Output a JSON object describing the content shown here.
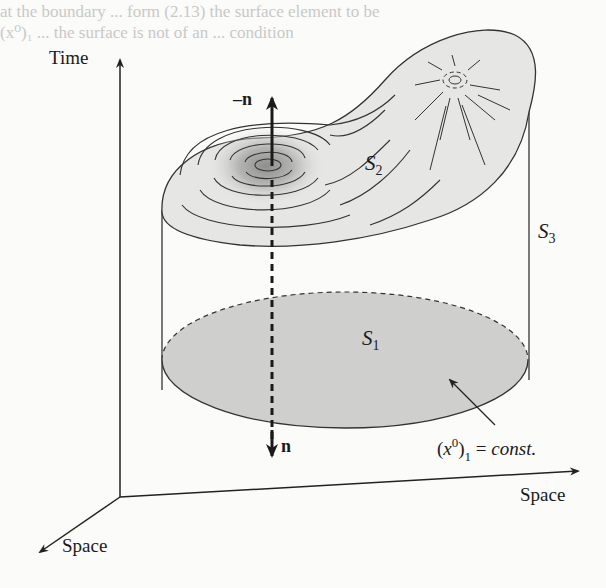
{
  "diagram": {
    "type": "spacetime-volume",
    "axes": {
      "vertical": "Time",
      "horizontal": "Space",
      "depth": "Space"
    },
    "surfaces": {
      "bottom": {
        "label": "S",
        "sub": "1",
        "fill": "#cfcfcd"
      },
      "top": {
        "label": "S",
        "sub": "2",
        "fill": "#e6e6e4"
      },
      "side": {
        "label": "S",
        "sub": "3"
      }
    },
    "normals": {
      "up": "–n",
      "down": "n"
    },
    "annotation": {
      "open": "(",
      "var": "x",
      "sup": "0",
      "close": ")",
      "sub": "1",
      "eq": " = ",
      "text": "const."
    },
    "bleed_text": [
      "at the boundary ... form (2.13) the surface element to be",
      "(x⁰)₁ ... the surface is not of an ... condition"
    ]
  }
}
